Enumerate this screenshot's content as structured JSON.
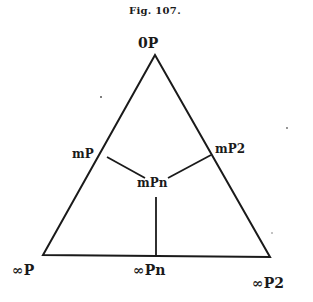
{
  "figure": {
    "caption": "Fig. 107."
  },
  "labels": {
    "top": "0P",
    "left_edge": "mP",
    "right_edge": "mP2",
    "center": "mPn",
    "bottom_left": "∞P",
    "bottom_middle": "∞Pn",
    "bottom_right": "∞P2"
  },
  "colors": {
    "line": "#1a1a1a",
    "background": "#ffffff"
  }
}
